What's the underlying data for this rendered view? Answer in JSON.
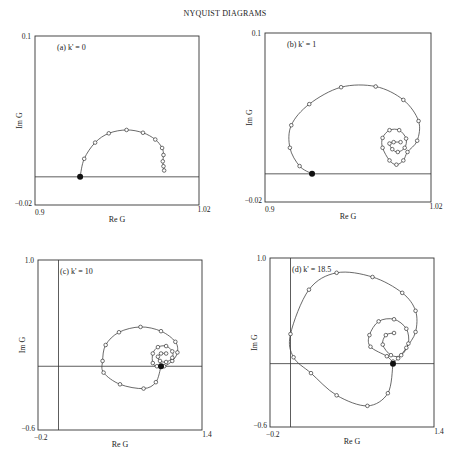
{
  "figure_title": "NYQUIST DIAGRAMS",
  "chart_data": [
    {
      "type": "line",
      "panel": "(a) k' = 0",
      "title": "(a) k' = 0",
      "xlabel": "Re G",
      "ylabel": "Im G",
      "xlim": [
        0.9,
        1.02
      ],
      "ylim": [
        -0.02,
        0.1
      ],
      "xtick_labels": [
        "0.9",
        "1.02"
      ],
      "ytick_labels": [
        "-0.02",
        "0.1"
      ],
      "reference_lines": {
        "im_zero": 0.0
      },
      "grid": false,
      "series": [
        {
          "name": "Nyquist locus",
          "points": [
            [
              0.933,
              0.0
            ],
            [
              0.936,
              0.0128
            ],
            [
              0.944,
              0.0243
            ],
            [
              0.954,
              0.0309
            ],
            [
              0.967,
              0.0333
            ],
            [
              0.979,
              0.0313
            ],
            [
              0.988,
              0.0265
            ],
            [
              0.993,
              0.0205
            ],
            [
              0.994,
              0.0155
            ],
            [
              0.9935,
              0.011
            ],
            [
              0.994,
              0.0075
            ],
            [
              0.9945,
              0.0045
            ]
          ],
          "filled_endpoint": [
            0.933,
            0.0
          ]
        }
      ]
    },
    {
      "type": "line",
      "panel": "(b) k' = 1",
      "title": "(b) k' = 1",
      "xlabel": "Re G",
      "ylabel": "Im G",
      "xlim": [
        0.9,
        1.02
      ],
      "ylim": [
        -0.02,
        0.1
      ],
      "xtick_labels": [
        "0.9",
        "1.02"
      ],
      "ytick_labels": [
        "-0.02",
        "0.1"
      ],
      "reference_lines": {
        "im_zero": 0.0
      },
      "grid": false,
      "series": [
        {
          "name": "Nyquist locus",
          "points": [
            [
              0.934,
              0.0
            ],
            [
              0.925,
              0.0055
            ],
            [
              0.918,
              0.0185
            ],
            [
              0.919,
              0.0345
            ],
            [
              0.932,
              0.0495
            ],
            [
              0.955,
              0.0615
            ],
            [
              0.98,
              0.062
            ],
            [
              1.0,
              0.0525
            ],
            [
              1.011,
              0.0375
            ],
            [
              1.01,
              0.0235
            ],
            [
              1.003,
              0.0155
            ],
            [
              1.0,
              0.0095
            ],
            [
              0.995,
              0.0065
            ],
            [
              0.99,
              0.0095
            ],
            [
              0.985,
              0.0185
            ],
            [
              0.985,
              0.0255
            ],
            [
              0.99,
              0.031
            ],
            [
              0.997,
              0.031
            ],
            [
              1.002,
              0.025
            ],
            [
              1.001,
              0.0185
            ],
            [
              0.996,
              0.0155
            ],
            [
              0.992,
              0.0175
            ],
            [
              0.99,
              0.0215
            ],
            [
              0.993,
              0.0225
            ],
            [
              0.998,
              0.0225
            ]
          ],
          "filled_endpoint": [
            0.934,
            0.0
          ]
        }
      ]
    },
    {
      "type": "line",
      "panel": "(c) k' = 10",
      "title": "(c) k' = 10",
      "xlabel": "Re G",
      "ylabel": "Im G",
      "xlim": [
        -0.2,
        1.4
      ],
      "ylim": [
        -0.6,
        1.0
      ],
      "xtick_labels": [
        "-0.2",
        "1.4"
      ],
      "ytick_labels": [
        "-0.6",
        "1.0"
      ],
      "reference_lines": {
        "re_zero": 0.0,
        "im_zero": 0.0
      },
      "grid": false,
      "series": [
        {
          "name": "Nyquist locus",
          "points": [
            [
              1.0,
              0.0
            ],
            [
              0.95,
              -0.15
            ],
            [
              0.83,
              -0.21
            ],
            [
              0.6,
              -0.17
            ],
            [
              0.44,
              -0.06
            ],
            [
              0.43,
              0.05
            ],
            [
              0.46,
              0.2
            ],
            [
              0.59,
              0.32
            ],
            [
              0.8,
              0.37
            ],
            [
              1.0,
              0.33
            ],
            [
              1.14,
              0.23
            ],
            [
              1.16,
              0.13
            ],
            [
              1.11,
              0.05
            ],
            [
              1.03,
              0.0
            ],
            [
              0.96,
              0.0
            ],
            [
              0.92,
              0.03
            ],
            [
              0.92,
              0.12
            ],
            [
              0.97,
              0.18
            ],
            [
              1.05,
              0.19
            ],
            [
              1.11,
              0.14
            ],
            [
              1.11,
              0.08
            ],
            [
              1.05,
              0.04
            ],
            [
              0.99,
              0.05
            ],
            [
              0.97,
              0.09
            ],
            [
              1.0,
              0.12
            ],
            [
              1.05,
              0.12
            ]
          ],
          "filled_endpoint": [
            1.0,
            0.0
          ]
        }
      ]
    },
    {
      "type": "line",
      "panel": "(d) k' = 18.5",
      "title": "(d) k' = 18.5",
      "xlabel": "Re G",
      "ylabel": "Im G",
      "xlim": [
        -0.2,
        1.4
      ],
      "ylim": [
        -0.6,
        1.0
      ],
      "xtick_labels": [
        "-0.2",
        "1.4"
      ],
      "ytick_labels": [
        "-0.6",
        "1.0"
      ],
      "reference_lines": {
        "re_zero": 0.0,
        "im_zero": 0.0
      },
      "grid": false,
      "series": [
        {
          "name": "Nyquist locus",
          "points": [
            [
              1.0,
              0.0
            ],
            [
              0.95,
              -0.28
            ],
            [
              0.75,
              -0.4
            ],
            [
              0.45,
              -0.3
            ],
            [
              0.2,
              -0.09
            ],
            [
              0.03,
              0.06
            ],
            [
              0.0,
              0.28
            ],
            [
              0.18,
              0.7
            ],
            [
              0.45,
              0.86
            ],
            [
              0.8,
              0.82
            ],
            [
              1.09,
              0.67
            ],
            [
              1.22,
              0.5
            ],
            [
              1.22,
              0.3
            ],
            [
              1.13,
              0.15
            ],
            [
              1.05,
              0.05
            ],
            [
              1.0,
              0.02
            ],
            [
              0.94,
              0.07
            ],
            [
              0.78,
              0.16
            ],
            [
              0.77,
              0.27
            ],
            [
              0.86,
              0.4
            ],
            [
              1.01,
              0.42
            ],
            [
              1.13,
              0.33
            ],
            [
              1.15,
              0.19
            ],
            [
              1.08,
              0.08
            ],
            [
              0.98,
              0.08
            ],
            [
              0.9,
              0.18
            ],
            [
              0.93,
              0.27
            ],
            [
              1.01,
              0.29
            ]
          ],
          "filled_endpoint": [
            1.0,
            0.0
          ]
        }
      ]
    }
  ]
}
